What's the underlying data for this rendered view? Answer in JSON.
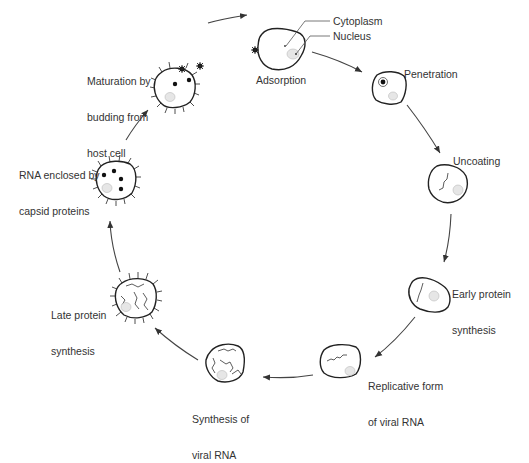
{
  "diagram": {
    "type": "viral-replication-cycle",
    "colors": {
      "line": "#222222",
      "text": "#333333",
      "nucleus": "#e6e6e6",
      "background": "#ffffff"
    },
    "callouts": {
      "cytoplasm": "Cytoplasm",
      "nucleus": "Nucleus"
    },
    "stages": [
      {
        "id": "adsorption",
        "lines": [
          "Adsorption"
        ]
      },
      {
        "id": "penetration",
        "lines": [
          "Penetration"
        ]
      },
      {
        "id": "uncoating",
        "lines": [
          "Uncoating"
        ]
      },
      {
        "id": "early-protein",
        "lines": [
          "Early protein",
          "synthesis"
        ]
      },
      {
        "id": "replicative-form",
        "lines": [
          "Replicative form",
          "of viral RNA"
        ]
      },
      {
        "id": "synthesis-rna",
        "lines": [
          "Synthesis of",
          "viral RNA"
        ]
      },
      {
        "id": "late-protein",
        "lines": [
          "Late protein",
          "synthesis"
        ]
      },
      {
        "id": "rna-enclosed",
        "lines": [
          "RNA enclosed by",
          "capsid proteins"
        ]
      },
      {
        "id": "maturation",
        "lines": [
          "Maturation by",
          "budding from",
          "host cell"
        ]
      }
    ]
  }
}
